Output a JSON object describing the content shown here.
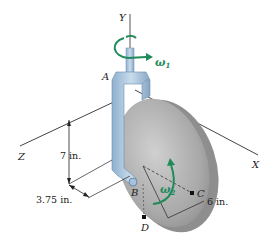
{
  "diagram": {
    "axes": {
      "y_label": "Y",
      "x_label": "X",
      "z_label": "Z"
    },
    "points": {
      "a": "A",
      "b": "B",
      "c": "C",
      "d": "D"
    },
    "angular_velocities": {
      "omega1": "ω",
      "omega1_sub": "1",
      "omega2": "ω",
      "omega2_sub": "2"
    },
    "dimensions": {
      "height": "7 in.",
      "offset": "3.75 in.",
      "radius": "6 in."
    },
    "colors": {
      "bracket": "#a9c4dc",
      "bracket_shade": "#7d9cb8",
      "disk": "#b7b7b7",
      "disk_edge": "#8e8e8e",
      "arrow_green": "#1f8a5a",
      "line": "#333333"
    }
  }
}
